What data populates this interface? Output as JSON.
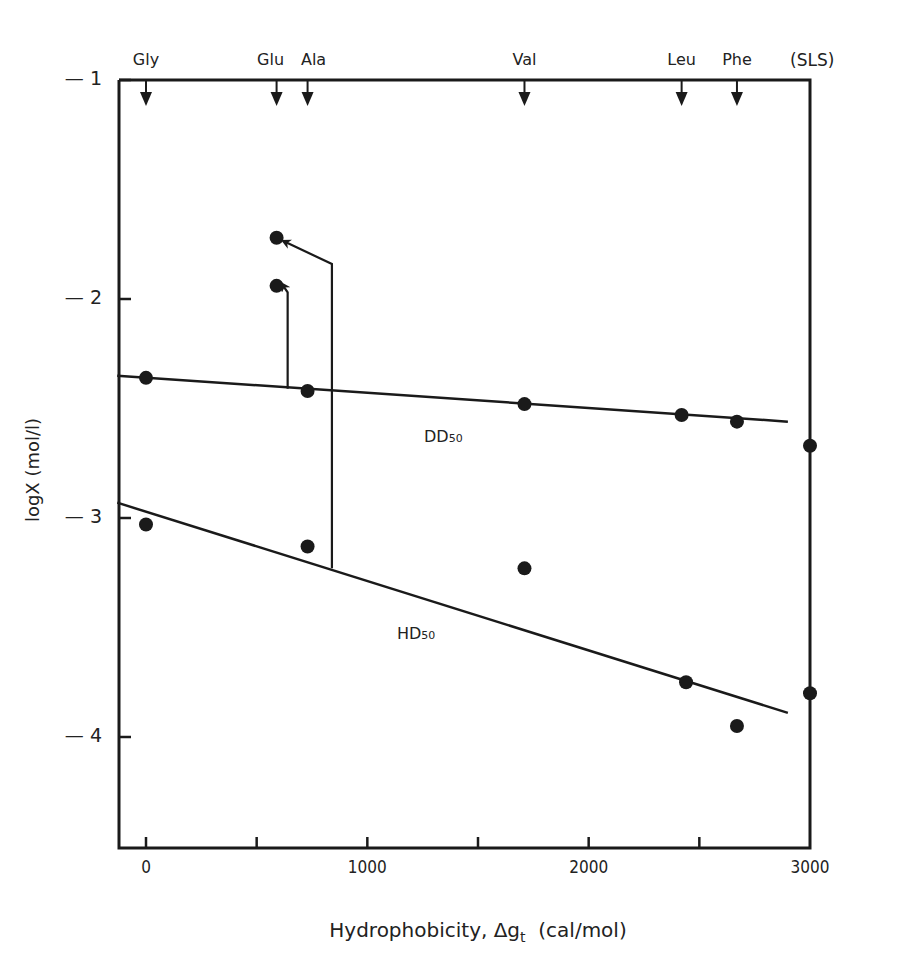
{
  "chart_data": {
    "type": "scatter",
    "title": "",
    "xlabel": "Hydrophobicity, Δg_t (cal/mol)",
    "xlabel_main": "Hydrophobicity, Δg",
    "xlabel_sub": "t",
    "xlabel_unit": "(cal/mol)",
    "ylabel": "logX  (mol/l)",
    "xlim": [
      -130,
      3000
    ],
    "ylim": [
      -4.5,
      -1
    ],
    "x_tick_labels": [
      "0",
      "1000",
      "2000",
      "3000"
    ],
    "x_ticks": [
      0,
      1000,
      2000,
      3000
    ],
    "x_minor_ticks": [
      0,
      500,
      1000,
      1500,
      2000,
      2500
    ],
    "y_tick_labels": [
      "— 1",
      "— 2",
      "— 3",
      "— 4"
    ],
    "y_ticks": [
      -1,
      -2,
      -3,
      -4
    ],
    "grid": false,
    "top_markers": [
      {
        "label": "Gly",
        "x": 0
      },
      {
        "label": "Glu",
        "x": 590
      },
      {
        "label": "Ala",
        "x": 730
      },
      {
        "label": "Val",
        "x": 1710
      },
      {
        "label": "Leu",
        "x": 2420
      },
      {
        "label": "Phe",
        "x": 2670
      }
    ],
    "top_extra_label": "(SLS)",
    "series": [
      {
        "name": "DD50",
        "label_main": "DD",
        "label_sub": "50",
        "points": [
          {
            "x": 0,
            "y": -2.36
          },
          {
            "x": 730,
            "y": -2.42
          },
          {
            "x": 1710,
            "y": -2.48
          },
          {
            "x": 2420,
            "y": -2.53
          },
          {
            "x": 2670,
            "y": -2.56
          },
          {
            "x": 3000,
            "y": -2.67
          }
        ],
        "fit_line": {
          "x1": -130,
          "y1": -2.35,
          "x2": 2900,
          "y2": -2.56
        }
      },
      {
        "name": "HD50",
        "label_main": "HD",
        "label_sub": "50",
        "points": [
          {
            "x": 0,
            "y": -3.03
          },
          {
            "x": 730,
            "y": -3.13
          },
          {
            "x": 1710,
            "y": -3.23
          },
          {
            "x": 2440,
            "y": -3.75
          },
          {
            "x": 2670,
            "y": -3.95
          },
          {
            "x": 3000,
            "y": -3.8
          }
        ],
        "fit_line": {
          "x1": -130,
          "y1": -2.93,
          "x2": 2900,
          "y2": -3.89
        }
      },
      {
        "name": "Glu (shifted)",
        "points": [
          {
            "x": 590,
            "y": -1.72
          },
          {
            "x": 590,
            "y": -1.94
          }
        ]
      }
    ],
    "annotations": [
      {
        "type": "arrow",
        "from": {
          "x": 640,
          "y": -2.41
        },
        "to": {
          "x": 620,
          "y": -1.94
        },
        "description": "Glu DD50 shifted point"
      },
      {
        "type": "arrow",
        "from": {
          "x": 840,
          "y": -3.23
        },
        "to": {
          "x": 630,
          "y": -1.74
        },
        "description": "Glu HD50 shifted point"
      }
    ]
  }
}
